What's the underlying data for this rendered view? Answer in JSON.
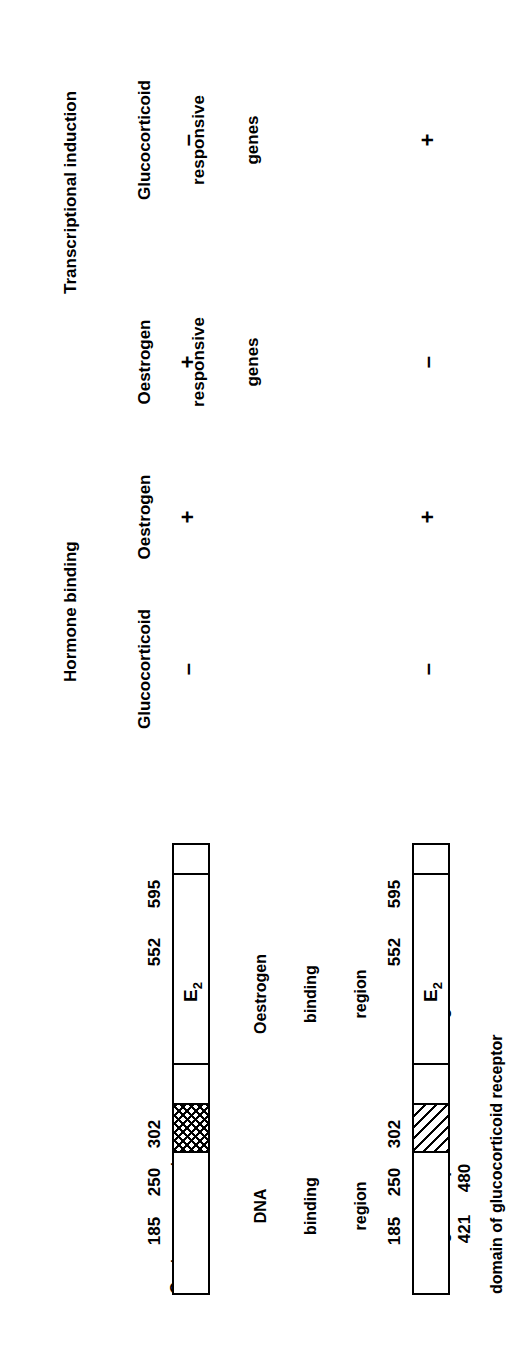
{
  "figure": {
    "orientation": "rotated-90-ccw"
  },
  "table": {
    "groups": [
      {
        "label": "Hormone binding"
      },
      {
        "label": "Transcriptional induction"
      }
    ],
    "columns": [
      {
        "label": "Glucocorticoid",
        "lines": [
          "Glucocorticoid"
        ]
      },
      {
        "label": "Oestrogen",
        "lines": [
          "Oestrogen"
        ]
      },
      {
        "label": "Oestrogen responsive genes",
        "lines": [
          "Oestrogen",
          "responsive",
          "genes"
        ]
      },
      {
        "label": "Glucocorticoid responsive genes",
        "lines": [
          "Glucocorticoid",
          "responsive",
          "genes"
        ]
      }
    ],
    "rows": [
      {
        "construct": "Oestrogen receptor",
        "values": [
          "–",
          "+",
          "+",
          "–"
        ]
      },
      {
        "construct": "Oestrogen receptor with DNA binding domain of glucocorticoid receptor",
        "values": [
          "–",
          "+",
          "–",
          "+"
        ]
      }
    ]
  },
  "constructs": [
    {
      "name": "Oestrogen receptor",
      "label_lines": [
        "Oestrogen receptor"
      ],
      "length": 595,
      "markers": [
        185,
        250,
        302,
        552,
        595
      ],
      "marker_labels": [
        "185",
        "250",
        "302",
        "552",
        "595"
      ],
      "segments": [
        {
          "name": "n-terminal",
          "start": 1,
          "end": 185,
          "fill": "white"
        },
        {
          "name": "dna-binding-region",
          "start": 185,
          "end": 250,
          "fill": "cross-hatch"
        },
        {
          "name": "hinge",
          "start": 250,
          "end": 302,
          "fill": "white"
        },
        {
          "name": "oestrogen-binding-region",
          "start": 302,
          "end": 552,
          "fill": "white",
          "inner_label": "E2"
        },
        {
          "name": "c-terminal",
          "start": 552,
          "end": 595,
          "fill": "white"
        }
      ],
      "annotations": [
        {
          "text_lines": [
            "DNA",
            "binding",
            "region"
          ],
          "target": "dna-binding-region"
        },
        {
          "text_lines": [
            "Oestrogen",
            "binding",
            "region"
          ],
          "target": "oestrogen-binding-region"
        }
      ],
      "inner_label": "E",
      "inner_label_sub": "2"
    },
    {
      "name": "Oestrogen receptor with DNA binding domain of glucocorticoid receptor",
      "label_lines": [
        "Oestrogen receptor with DNA binding",
        "domain of glucocorticoid receptor"
      ],
      "length": 595,
      "markers": [
        185,
        250,
        302,
        552,
        595
      ],
      "marker_labels": [
        "185",
        "250",
        "302",
        "552",
        "595"
      ],
      "lower_marker_labels": [
        "421",
        "480"
      ],
      "segments": [
        {
          "name": "n-terminal",
          "start": 1,
          "end": 185,
          "fill": "white"
        },
        {
          "name": "gr-dna-binding-domain",
          "start": 185,
          "end": 250,
          "fill": "diagonal-hatch"
        },
        {
          "name": "hinge",
          "start": 250,
          "end": 302,
          "fill": "white"
        },
        {
          "name": "oestrogen-binding-region",
          "start": 302,
          "end": 552,
          "fill": "white",
          "inner_label": "E2"
        },
        {
          "name": "c-terminal",
          "start": 552,
          "end": 595,
          "fill": "white"
        }
      ],
      "inner_label": "E",
      "inner_label_sub": "2"
    }
  ],
  "colors": {
    "ink": "#000000",
    "paper": "#ffffff"
  }
}
